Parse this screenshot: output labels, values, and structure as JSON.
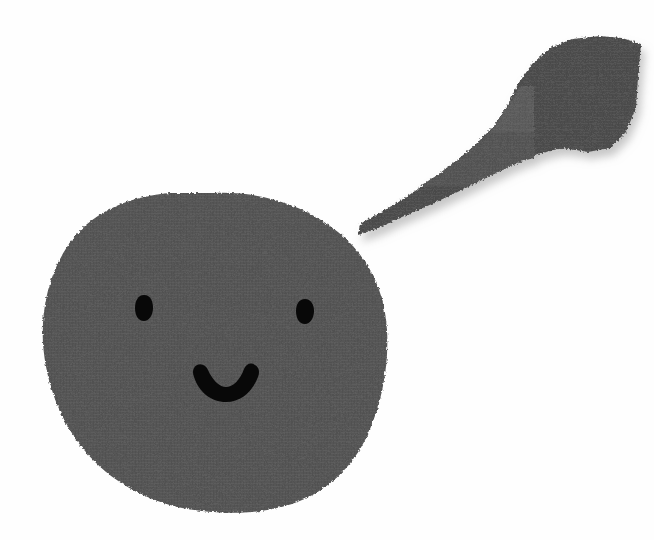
{
  "scene": {
    "title": "Torn paper collage face",
    "width": 654,
    "height": 540,
    "background_color": "#fefefe",
    "alt_text": "A large dark gray torn-paper circle with two black oval eyes and a black smiling mouth, with a long diagonal torn paper strip above and to the right of it."
  },
  "palette": {
    "background": "#fefefe",
    "face_gray": "#565656",
    "face_gray_dark": "#4f4f4f",
    "strip_gray": "#4e4e4e",
    "strip_highlight": "#5d5d5d",
    "feature_black": "#080808",
    "shadow": "#bdbdbd"
  },
  "elements": {
    "face": {
      "name": "Face blob",
      "shape": "torn-paper circle",
      "fill": "#565656",
      "bounds": {
        "x": 42,
        "y": 192,
        "width": 346,
        "height": 320
      },
      "center": {
        "x": 214,
        "y": 352
      }
    },
    "left_eye": {
      "name": "Left eye",
      "shape": "oval",
      "fill": "#080808",
      "bounds": {
        "x": 135,
        "y": 295,
        "width": 18,
        "height": 26
      },
      "center": {
        "x": 144,
        "y": 308
      }
    },
    "right_eye": {
      "name": "Right eye",
      "shape": "oval",
      "fill": "#080808",
      "bounds": {
        "x": 296,
        "y": 299,
        "width": 18,
        "height": 25
      },
      "center": {
        "x": 305,
        "y": 311
      }
    },
    "mouth": {
      "name": "Smiling mouth",
      "shape": "thick downward arc",
      "fill": "#080808",
      "bounds": {
        "x": 196,
        "y": 364,
        "width": 58,
        "height": 24
      },
      "center": {
        "x": 225,
        "y": 376
      }
    },
    "paper_strip": {
      "name": "Torn paper strip",
      "shape": "elongated torn diagonal band",
      "fill": "#4e4e4e",
      "bounds": {
        "x": 356,
        "y": 36,
        "width": 286,
        "height": 200
      },
      "angle_description": "rises left-to-right at about 30 degrees",
      "highlight_patch": {
        "name": "Lighter overlap patch",
        "fill": "#5d5d5d",
        "bounds": {
          "x": 462,
          "y": 88,
          "width": 72,
          "height": 44
        }
      },
      "shadow": {
        "name": "Drop shadow",
        "fill": "#bdbdbd",
        "offset": {
          "x": 4,
          "y": 7
        }
      }
    }
  }
}
